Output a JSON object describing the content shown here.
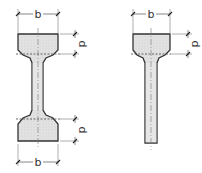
{
  "diagram": {
    "title": "",
    "figures": [
      {
        "name": "double-tee-section",
        "labels": {
          "top_width": "b",
          "top_depth": "d",
          "bottom_depth": "d",
          "bottom_width": "b"
        }
      },
      {
        "name": "single-flange-section",
        "labels": {
          "top_width": "b",
          "top_depth": "d"
        }
      }
    ],
    "colors": {
      "section_fill": "#dcdcdc",
      "outline": "#333333",
      "dimension": "#555555"
    }
  }
}
